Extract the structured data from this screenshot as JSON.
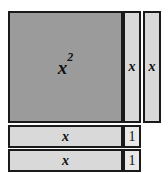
{
  "diagram": {
    "colors": {
      "x_squared_fill": "#9b9b9b",
      "x_tile_fill": "#d9d9d9",
      "unit_tile_fill": "#e8e8e8",
      "border": "#1a1a1a",
      "background": "#ffffff",
      "text": "#111111"
    },
    "tiles": {
      "x_squared": {
        "label_base": "x",
        "label_exponent": "2",
        "name": "x-squared-tile"
      },
      "x_right_1": {
        "label": "x",
        "name": "x-tile-right-1"
      },
      "x_right_2": {
        "label": "x",
        "name": "x-tile-right-2"
      },
      "x_bottom_1": {
        "label": "x",
        "name": "x-tile-bottom-1"
      },
      "x_bottom_2": {
        "label": "x",
        "name": "x-tile-bottom-2"
      },
      "unit_1": {
        "label": "1",
        "name": "unit-tile-1"
      },
      "unit_2": {
        "label": "1",
        "name": "unit-tile-2"
      }
    }
  }
}
